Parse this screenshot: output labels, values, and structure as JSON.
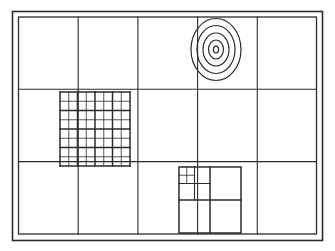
{
  "figure": {
    "kind": "test-chart",
    "background": "#ffffff",
    "ink": "#2b2b2b",
    "canvas": {
      "width": 335,
      "height": 251
    }
  },
  "frame": {
    "outer": {
      "x": 12.5,
      "y": 11.5,
      "width": 310,
      "height": 229,
      "stroke_width": 1.6
    },
    "inner": {
      "x": 18.5,
      "y": 17.0,
      "width": 298,
      "height": 217,
      "stroke_width": 1.3
    },
    "gap_label": "double-rule border"
  },
  "grid": {
    "columns": 5,
    "rows": 3,
    "column_edges": [
      18.5,
      78.2,
      137.9,
      197.6,
      257.3,
      316.5
    ],
    "row_edges": [
      17.0,
      89.3,
      161.6,
      234.0
    ],
    "stroke_width": 1.1,
    "cells": [
      {
        "id": "r1c1",
        "content": "blank"
      },
      {
        "id": "r1c2",
        "content": "blank"
      },
      {
        "id": "r1c3",
        "content": "blank"
      },
      {
        "id": "r1c4",
        "content": "concentric-target"
      },
      {
        "id": "r1c5",
        "content": "blank"
      },
      {
        "id": "r2c1",
        "content": "blank"
      },
      {
        "id": "r2c2",
        "content": "fine-square-grid"
      },
      {
        "id": "r2c3",
        "content": "blank"
      },
      {
        "id": "r2c4",
        "content": "blank"
      },
      {
        "id": "r2c5",
        "content": "blank"
      },
      {
        "id": "r3c1",
        "content": "blank"
      },
      {
        "id": "r3c2",
        "content": "blank"
      },
      {
        "id": "r3c3",
        "content": "blank"
      },
      {
        "id": "r3c4",
        "content": "recursive-subdivision-grid"
      },
      {
        "id": "r3c5",
        "content": "blank"
      }
    ]
  },
  "target": {
    "name": "concentric-ellipse-target",
    "cell": "r1c4",
    "center_x": 216.0,
    "center_y": 49.5,
    "ring_count": 5,
    "rings": [
      {
        "rx": 25.0,
        "ry": 31.0,
        "stroke_width": 1.2
      },
      {
        "rx": 19.0,
        "ry": 24.0,
        "stroke_width": 1.2
      },
      {
        "rx": 13.0,
        "ry": 16.5,
        "stroke_width": 1.2
      },
      {
        "rx": 7.5,
        "ry": 9.5,
        "stroke_width": 1.2
      },
      {
        "rx": 2.6,
        "ry": 3.3,
        "stroke_width": 1.2
      }
    ]
  },
  "fine_grid": {
    "name": "fine-square-grid",
    "cell": "r2c2",
    "x": 60.0,
    "y": 92.0,
    "width": 70.0,
    "height": 74.0,
    "columns": 8,
    "rows": 8,
    "major_every": 2,
    "minor_stroke_width": 0.8,
    "major_stroke_width": 1.5
  },
  "recursive_grid": {
    "name": "recursive-subdivision-grid",
    "cell": "r3c4",
    "x": 179.0,
    "y": 167.0,
    "width": 62.0,
    "height": 66.0,
    "levels": 3,
    "level_divisions": [
      2,
      2,
      2
    ],
    "description": "quadrant recursively subdivided into its top-left corner",
    "stroke_widths": [
      1.5,
      1.1,
      0.8
    ]
  },
  "legend": {
    "elements": [
      "double-rule outer frame",
      "5 x 3 cell grid",
      "5-ring concentric ellipse target",
      "8 x 8 fine square grid",
      "3-level recursive subdivision block"
    ]
  }
}
